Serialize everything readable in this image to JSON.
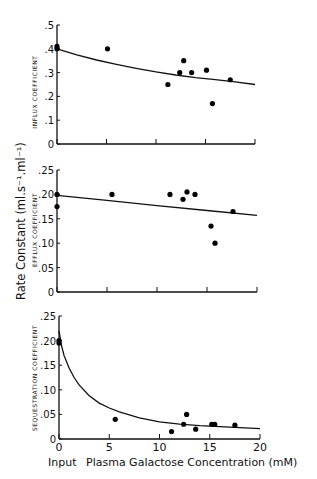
{
  "chart_data": [
    {
      "type": "scatter",
      "panel": "top",
      "ylabel": "INFLUX COEFFICIENT",
      "xlim": [
        0,
        20
      ],
      "ylim": [
        0,
        0.5
      ],
      "yticks": [
        0,
        0.1,
        0.2,
        0.3,
        0.4,
        0.5
      ],
      "ytick_labels": [
        "0",
        ".1",
        ".2",
        ".3",
        ".4",
        ".5"
      ],
      "xticks": [
        0,
        5,
        10,
        15,
        20
      ],
      "show_xtick_labels": false,
      "points": {
        "x": [
          0,
          0,
          5.1,
          11.2,
          12.4,
          12.8,
          13.6,
          15.1,
          15.7,
          17.5
        ],
        "y": [
          0.4,
          0.41,
          0.4,
          0.25,
          0.3,
          0.35,
          0.3,
          0.31,
          0.17,
          0.27
        ]
      },
      "fit_curve": {
        "x": [
          0,
          2,
          4,
          6,
          8,
          10,
          12,
          14,
          16,
          18,
          20
        ],
        "y": [
          0.4,
          0.375,
          0.353,
          0.335,
          0.318,
          0.303,
          0.29,
          0.279,
          0.27,
          0.261,
          0.25
        ]
      }
    },
    {
      "type": "scatter",
      "panel": "middle",
      "ylabel": "EFFLUX COEFFICIENT",
      "xlim": [
        0,
        20
      ],
      "ylim": [
        0,
        0.25
      ],
      "yticks": [
        0,
        0.05,
        0.1,
        0.15,
        0.2,
        0.25
      ],
      "ytick_labels": [
        "0",
        ".05",
        ".10",
        ".15",
        ".20",
        ".25"
      ],
      "xticks": [
        0,
        5,
        10,
        15,
        20
      ],
      "show_xtick_labels": false,
      "points": {
        "x": [
          0,
          0,
          5.5,
          11.3,
          12.6,
          13.0,
          13.8,
          15.4,
          15.8,
          17.6
        ],
        "y": [
          0.2,
          0.175,
          0.2,
          0.2,
          0.19,
          0.205,
          0.2,
          0.135,
          0.1,
          0.165
        ]
      },
      "fit_curve": {
        "x": [
          0,
          5,
          10,
          15,
          20
        ],
        "y": [
          0.198,
          0.188,
          0.177,
          0.167,
          0.157
        ]
      }
    },
    {
      "type": "scatter",
      "panel": "bottom",
      "ylabel": "SEQUESTRATION COEFFICIENT",
      "xlim": [
        0,
        20
      ],
      "ylim": [
        0,
        0.25
      ],
      "yticks": [
        0,
        0.05,
        0.1,
        0.15,
        0.2,
        0.25
      ],
      "ytick_labels": [
        "0",
        ".05",
        ".10",
        ".15",
        ".20",
        ".25"
      ],
      "xticks": [
        0,
        5,
        10,
        15,
        20
      ],
      "show_xtick_labels": true,
      "xtick_labels": [
        "0",
        "5",
        "10",
        "15",
        "20"
      ],
      "points": {
        "x": [
          0,
          0,
          5.6,
          11.2,
          12.4,
          12.7,
          13.6,
          15.2,
          15.5,
          17.5
        ],
        "y": [
          0.2,
          0.195,
          0.04,
          0.015,
          0.03,
          0.05,
          0.02,
          0.03,
          0.03,
          0.028
        ]
      },
      "fit_curve": {
        "x": [
          0,
          0.25,
          0.5,
          1,
          1.5,
          2,
          3,
          4,
          5,
          6,
          8,
          10,
          12,
          14,
          16,
          18,
          20
        ],
        "y": [
          0.22,
          0.19,
          0.17,
          0.145,
          0.125,
          0.11,
          0.088,
          0.073,
          0.063,
          0.055,
          0.043,
          0.035,
          0.03,
          0.027,
          0.025,
          0.023,
          0.021
        ]
      }
    }
  ],
  "labels": {
    "shared_ylabel": "Rate Constant (ml.s⁻¹.ml⁻¹)",
    "xlabel_input": "Input",
    "xlabel": "Plasma Galactose Concentration (mM)"
  }
}
